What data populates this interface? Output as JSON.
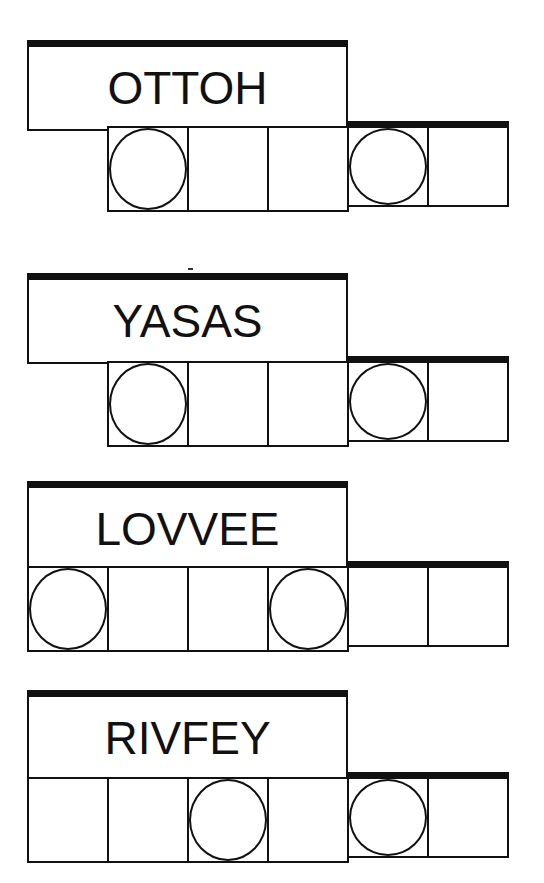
{
  "puzzles": [
    {
      "word": "OTTOH",
      "cells": 5,
      "circled": [
        1,
        4
      ],
      "top": 40,
      "cells_left": 107,
      "cells_top": 126
    },
    {
      "word": "YASAS",
      "cells": 5,
      "circled": [
        1,
        4
      ],
      "top": 273,
      "cells_left": 107,
      "cells_top": 361
    },
    {
      "word": "LOVVEE",
      "cells": 6,
      "circled": [
        1,
        4
      ],
      "top": 481,
      "cells_left": 27,
      "cells_top": 566
    },
    {
      "word": "RIVFEY",
      "cells": 6,
      "circled": [
        3,
        5
      ],
      "top": 690,
      "cells_left": 27,
      "cells_top": 777
    }
  ],
  "colors": {
    "ink": "#111111",
    "background": "#ffffff"
  }
}
